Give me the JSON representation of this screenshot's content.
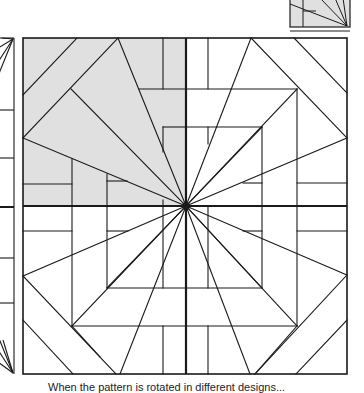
{
  "figure": {
    "caption": "When the pattern is rotated in different designs..."
  },
  "colors": {
    "background": "#ffffff",
    "shade": "#e0e0e0",
    "line": "#1a1a1a"
  },
  "main_square": {
    "x": 23,
    "y": 38,
    "width": 324,
    "height": 336,
    "center": [
      186,
      206
    ]
  },
  "thumbnail": {
    "x": 290,
    "y": 0,
    "width": 60,
    "height": 27
  },
  "left_strip": {
    "x": 0,
    "y": 38,
    "width": 14,
    "height": 336
  }
}
